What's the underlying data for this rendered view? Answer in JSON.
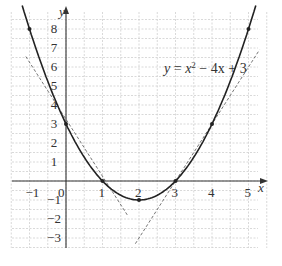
{
  "diagram": {
    "equation_label": "y = x² − 4x + 3",
    "equation_parts": {
      "y": "y",
      "eq": " = ",
      "x": "x",
      "sup": "2",
      "rest": " − 4x + 3"
    },
    "axis_labels": {
      "x": "x",
      "y": "y"
    },
    "x_ticks": [
      "−1",
      "0",
      "1",
      "2",
      "3",
      "4",
      "5"
    ],
    "y_ticks": [
      "8",
      "7",
      "6",
      "5",
      "4",
      "3",
      "2",
      "1",
      "−1",
      "−2",
      "−3"
    ],
    "origin_label": "0",
    "colors": {
      "curve": "#222222",
      "grid": "#c8c8c8",
      "tangent": "#666666",
      "axis": "#333333"
    }
  },
  "chart_data": {
    "type": "line",
    "xlabel": "x",
    "ylabel": "y",
    "xlim": [
      -1.2,
      5.3
    ],
    "ylim": [
      -3.5,
      8.5
    ],
    "grid": true,
    "series": [
      {
        "name": "y = x^2 - 4x + 3",
        "style": "solid",
        "x": [
          -1,
          0,
          1,
          2,
          3,
          4,
          5
        ],
        "y": [
          8,
          3,
          0,
          -1,
          0,
          3,
          8
        ]
      },
      {
        "name": "tangent at x=0.5 (y = -3x + 3.25)",
        "style": "dashed",
        "x": [
          -1.1,
          1.7
        ],
        "y": [
          6.55,
          -1.85
        ]
      },
      {
        "name": "tangent at x=3.5 (y = 3x - 9)",
        "style": "dashed",
        "x": [
          1.9,
          5.3
        ],
        "y": [
          -3.3,
          6.9
        ]
      }
    ],
    "marked_points": [
      [
        -1,
        8
      ],
      [
        0,
        3
      ],
      [
        1,
        0
      ],
      [
        2,
        -1
      ],
      [
        3,
        0
      ],
      [
        4,
        3
      ],
      [
        5,
        8
      ]
    ]
  }
}
